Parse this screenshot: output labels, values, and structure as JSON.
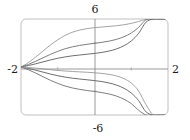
{
  "figure": {
    "width": 190,
    "height": 140,
    "background": "#ffffff"
  },
  "chart_data": {
    "type": "line",
    "title": "",
    "subtitle": "",
    "xlabel": "",
    "ylabel": "",
    "xlim": [
      -2,
      2
    ],
    "ylim": [
      -6,
      6
    ],
    "grid": false,
    "legend": false,
    "legend_position": "none",
    "axis_tick_labels": {
      "top": "6",
      "bottom": "-6",
      "left": "-2",
      "right": "2"
    },
    "xticks": [
      -2,
      -1,
      0,
      1,
      2
    ],
    "yticks": [
      -6,
      -3,
      0,
      3,
      6
    ],
    "visible_tick_labels": [
      "-2",
      "2",
      "6",
      "-6"
    ],
    "common_point": [
      -2,
      0
    ],
    "series": [
      {
        "name": "curve-1",
        "color": "#9a9a9a",
        "width": 0.9,
        "x": [
          -2.0,
          -1.8,
          -1.6,
          -1.4,
          -1.2,
          -1.0,
          -0.8,
          -0.6,
          -0.4,
          -0.2,
          0.0,
          0.2,
          0.4,
          0.6,
          0.8,
          1.0,
          1.2,
          1.4,
          1.6,
          1.8,
          2.0
        ],
        "y": [
          0.0,
          0.55,
          1.25,
          2.0,
          2.75,
          3.4,
          3.95,
          4.35,
          4.62,
          4.8,
          4.92,
          5.0,
          5.08,
          5.16,
          5.28,
          5.45,
          5.68,
          5.95,
          6.0,
          6.0,
          6.0
        ]
      },
      {
        "name": "curve-2",
        "color": "#6f6f6f",
        "width": 0.9,
        "x": [
          -2.0,
          -1.8,
          -1.6,
          -1.4,
          -1.2,
          -1.0,
          -0.8,
          -0.6,
          -0.4,
          -0.2,
          0.0,
          0.2,
          0.4,
          0.6,
          0.8,
          1.0,
          1.2,
          1.4,
          1.6,
          1.8,
          2.0
        ],
        "y": [
          0.0,
          0.32,
          0.72,
          1.15,
          1.58,
          1.96,
          2.28,
          2.52,
          2.7,
          2.84,
          2.96,
          3.08,
          3.24,
          3.46,
          3.78,
          4.25,
          4.95,
          5.9,
          6.0,
          6.0,
          6.0
        ]
      },
      {
        "name": "curve-3",
        "color": "#5e5e5e",
        "width": 0.9,
        "x": [
          -2.0,
          -1.8,
          -1.6,
          -1.4,
          -1.2,
          -1.0,
          -0.8,
          -0.6,
          -0.4,
          -0.2,
          0.0,
          0.2,
          0.4,
          0.6,
          0.8,
          1.0,
          1.2,
          1.4,
          1.6,
          1.8,
          2.0
        ],
        "y": [
          0.0,
          0.18,
          0.4,
          0.64,
          0.88,
          1.09,
          1.26,
          1.4,
          1.5,
          1.6,
          1.7,
          1.82,
          2.0,
          2.26,
          2.66,
          3.25,
          4.2,
          5.6,
          6.0,
          6.0,
          6.0
        ]
      },
      {
        "name": "curve-4",
        "color": "#5e5e5e",
        "width": 0.9,
        "x": [
          -2.0,
          -1.8,
          -1.6,
          -1.4,
          -1.2,
          -1.0,
          -0.8,
          -0.6,
          -0.4,
          -0.2,
          0.0,
          0.2,
          0.4,
          0.6,
          0.8,
          1.0,
          1.2,
          1.4,
          1.6,
          1.8,
          2.0
        ],
        "y": [
          0.0,
          -0.18,
          -0.4,
          -0.64,
          -0.88,
          -1.09,
          -1.26,
          -1.4,
          -1.5,
          -1.6,
          -1.7,
          -1.82,
          -2.0,
          -2.26,
          -2.66,
          -3.25,
          -4.2,
          -5.6,
          -6.0,
          -6.0,
          -6.0
        ]
      },
      {
        "name": "curve-5",
        "color": "#6f6f6f",
        "width": 0.9,
        "x": [
          -2.0,
          -1.8,
          -1.6,
          -1.4,
          -1.2,
          -1.0,
          -0.8,
          -0.6,
          -0.4,
          -0.2,
          0.0,
          0.2,
          0.4,
          0.6,
          0.8,
          1.0,
          1.2,
          1.4,
          1.6,
          1.8,
          2.0
        ],
        "y": [
          0.0,
          -0.34,
          -0.76,
          -1.22,
          -1.66,
          -2.05,
          -2.38,
          -2.62,
          -2.8,
          -2.94,
          -3.06,
          -3.2,
          -3.38,
          -3.64,
          -4.02,
          -4.58,
          -5.4,
          -6.0,
          -6.0,
          -6.0,
          -6.0
        ]
      },
      {
        "name": "curve-6",
        "color": "#9a9a9a",
        "width": 0.9,
        "x": [
          -2.0,
          -1.8,
          -1.6,
          -1.4,
          -1.2,
          -1.0,
          -0.8,
          -0.6,
          -0.4,
          -0.2,
          0.0,
          0.2,
          0.4,
          0.6,
          0.8,
          1.0,
          1.2,
          1.4,
          1.6,
          1.8,
          2.0
        ],
        "y": [
          0.0,
          -0.06,
          -0.14,
          -0.24,
          -0.34,
          -0.43,
          -0.5,
          -0.56,
          -0.61,
          -0.66,
          -0.72,
          -0.8,
          -0.92,
          -1.12,
          -1.45,
          -2.0,
          -3.0,
          -4.7,
          -6.0,
          -6.0,
          -6.0
        ]
      }
    ]
  },
  "colors": {
    "frame": "#b9b9b9",
    "axis": "#8e8e8e",
    "tick": "#9e9e9e",
    "label_text": "#1c1c1c",
    "background": "#ffffff"
  }
}
